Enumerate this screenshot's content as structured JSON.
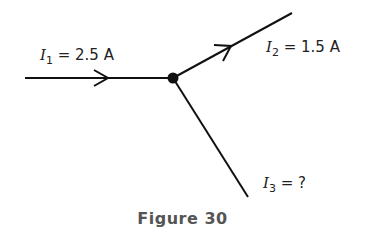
{
  "figure": {
    "caption": "Figure 30",
    "currents": [
      {
        "symbol": "I",
        "subscript": "1",
        "text": " = 2.5 A",
        "direction": "into junction"
      },
      {
        "symbol": "I",
        "subscript": "2",
        "text": " = 1.5 A",
        "direction": "out of junction"
      },
      {
        "symbol": "I",
        "subscript": "3",
        "text": " = ?",
        "direction": "unknown"
      }
    ],
    "colors": {
      "line": "#111111",
      "text": "#222222",
      "caption": "#555555"
    }
  }
}
